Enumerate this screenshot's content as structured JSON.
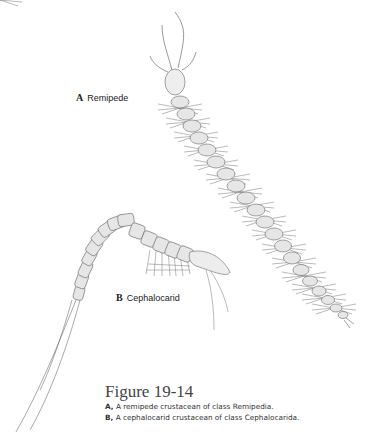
{
  "figure": {
    "labels": {
      "a": {
        "letter": "A",
        "name": "Remipede"
      },
      "b": {
        "letter": "B",
        "name": "Cephalocarid"
      }
    },
    "caption": {
      "title": "Figure 19-14",
      "lines": [
        {
          "letter": "A,",
          "text": " A remipede crustacean of class Remipedia."
        },
        {
          "letter": "B,",
          "text": " A cephalocarid crustacean of class Cephalocarida."
        }
      ]
    },
    "illustrations": [
      {
        "id": "remipede",
        "description": "Remipede crustacean line drawing"
      },
      {
        "id": "cephalocarid",
        "description": "Cephalocarid crustacean line drawing"
      }
    ],
    "colors": {
      "ink": "#555555",
      "fill": "#e4e4e4",
      "background": "#ffffff"
    }
  }
}
